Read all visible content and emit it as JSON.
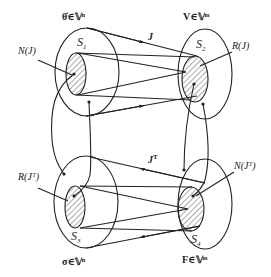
{
  "diagram": {
    "sets": {
      "s1": {
        "name": "S",
        "sub": "1",
        "space_label": "θ̇∈𝕍ⁿ",
        "subspace_label": "N(J)"
      },
      "s2": {
        "name": "S",
        "sub": "2",
        "space_label": "V∈𝕍ᵐ",
        "subspace_label": "R(J)"
      },
      "s3": {
        "name": "S",
        "sub": "3",
        "space_label": "σ∈𝕍ⁿ",
        "subspace_label": "R(Jᵀ)"
      },
      "s4": {
        "name": "S",
        "sub": "4",
        "space_label": "F∈𝕍ᵐ",
        "subspace_label": "N(Jᵀ)"
      }
    },
    "mappings": {
      "forward": "J",
      "transpose_base": "J",
      "transpose_sup": "T"
    },
    "colors": {
      "stroke": "#222222",
      "hatch": "#444444",
      "background": "#ffffff"
    }
  }
}
